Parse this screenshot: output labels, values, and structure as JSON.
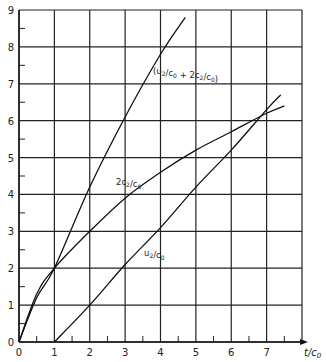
{
  "chart_data": {
    "type": "line",
    "title": "",
    "xlabel": "t/c0",
    "ylabel": "",
    "xlim": [
      0,
      8
    ],
    "ylim": [
      0,
      9
    ],
    "grid": true,
    "x_ticks": [
      "0",
      "1",
      "2",
      "3",
      "4",
      "5",
      "6",
      "7"
    ],
    "y_ticks": [
      "0",
      "1",
      "2",
      "3",
      "4",
      "5",
      "6",
      "7",
      "8",
      "9"
    ],
    "series": [
      {
        "name": "(u2/c0 + 2c2/c0)",
        "x": [
          0,
          0.5,
          1,
          2,
          3,
          4,
          4.7
        ],
        "y": [
          0,
          1.2,
          2,
          4.2,
          6.1,
          7.8,
          8.8
        ]
      },
      {
        "name": "2c2/c0",
        "x": [
          0,
          0.5,
          1,
          2,
          3,
          4,
          5,
          6,
          7,
          7.5
        ],
        "y": [
          0,
          1.3,
          2,
          3.0,
          3.9,
          4.6,
          5.2,
          5.7,
          6.2,
          6.4
        ]
      },
      {
        "name": "u2/c0",
        "x": [
          1,
          2,
          3,
          4,
          5,
          6,
          7,
          7.4
        ],
        "y": [
          0,
          1.0,
          2.1,
          3.1,
          4.2,
          5.2,
          6.3,
          6.7
        ]
      }
    ],
    "annotations": [
      {
        "text": "(u2/c0 + 2c2/c0)",
        "x": 4.0,
        "y": 7.2
      },
      {
        "text": "2c2/c0",
        "x": 3.2,
        "y": 4.5
      },
      {
        "text": "u2/c0",
        "x": 4.3,
        "y": 2.3
      }
    ]
  },
  "labels": {
    "xaxis": "t/c0",
    "curve_sum": "(u2/c0 + 2c2/c0)",
    "curve_2c": "2c2/c0",
    "curve_u": "u2/c0"
  }
}
